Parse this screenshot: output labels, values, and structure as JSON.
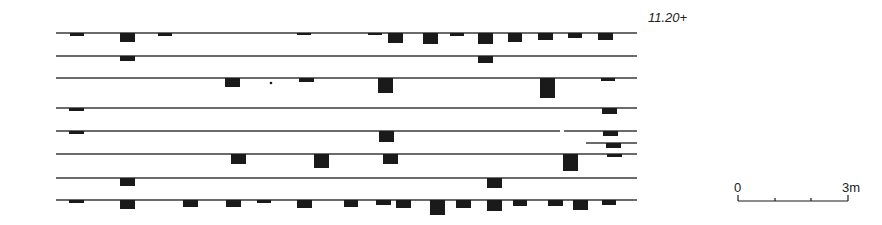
{
  "level_label": "11.20+",
  "scale": {
    "start_label": "0",
    "end_label": "3m",
    "x_start": 738,
    "x_end": 848,
    "y": 201,
    "ticks": [
      738,
      775,
      811,
      848
    ]
  },
  "colors": {
    "ink": "#1a1a1a",
    "line": "#3a3a3a",
    "background": "#ffffff"
  },
  "courses": [
    {
      "y": 33,
      "x1": 56,
      "x2": 637,
      "blocks": [
        [
          70,
          84,
          3
        ],
        [
          120,
          135,
          9
        ],
        [
          158,
          172,
          3
        ],
        [
          297,
          311,
          2
        ],
        [
          368,
          382,
          2
        ],
        [
          388,
          403,
          10
        ],
        [
          423,
          438,
          11
        ],
        [
          450,
          464,
          3
        ],
        [
          478,
          493,
          11
        ],
        [
          508,
          522,
          9
        ],
        [
          538,
          553,
          7
        ],
        [
          568,
          582,
          5
        ],
        [
          598,
          613,
          7
        ]
      ]
    },
    {
      "y": 56,
      "x1": 56,
      "x2": 637,
      "blocks": [
        [
          120,
          135,
          5
        ],
        [
          478,
          493,
          7
        ]
      ]
    },
    {
      "y": 78,
      "x1": 56,
      "x2": 637,
      "blocks": [
        [
          225,
          240,
          9
        ],
        [
          299,
          314,
          4
        ],
        [
          378,
          393,
          15
        ],
        [
          540,
          555,
          20
        ],
        [
          601,
          615,
          3
        ]
      ]
    },
    {
      "y": 108,
      "x1": 56,
      "x2": 637,
      "blocks": [
        [
          69,
          84,
          3
        ],
        [
          602,
          617,
          6
        ]
      ]
    },
    {
      "y": 131,
      "x1": 56,
      "x2": 560,
      "blocks": [
        [
          69,
          84,
          3
        ],
        [
          379,
          394,
          11
        ]
      ]
    },
    {
      "y": 131,
      "x1": 564,
      "x2": 637,
      "blocks": [
        [
          603,
          618,
          5
        ]
      ]
    },
    {
      "y": 143,
      "x1": 586,
      "x2": 637,
      "blocks": [
        [
          606,
          621,
          5
        ]
      ]
    },
    {
      "y": 154,
      "x1": 56,
      "x2": 637,
      "blocks": [
        [
          231,
          246,
          10
        ],
        [
          314,
          329,
          14
        ],
        [
          383,
          398,
          10
        ],
        [
          563,
          578,
          17
        ],
        [
          607,
          622,
          3
        ]
      ]
    },
    {
      "y": 178,
      "x1": 56,
      "x2": 637,
      "blocks": [
        [
          120,
          135,
          8
        ],
        [
          487,
          502,
          10
        ]
      ]
    },
    {
      "y": 200,
      "x1": 56,
      "x2": 637,
      "blocks": [
        [
          69,
          84,
          3
        ],
        [
          120,
          135,
          9
        ],
        [
          183,
          198,
          7
        ],
        [
          226,
          241,
          7
        ],
        [
          257,
          271,
          3
        ],
        [
          297,
          312,
          8
        ],
        [
          344,
          358,
          7
        ],
        [
          376,
          391,
          5
        ],
        [
          396,
          411,
          8
        ],
        [
          430,
          445,
          15
        ],
        [
          456,
          471,
          8
        ],
        [
          487,
          502,
          11
        ],
        [
          513,
          527,
          6
        ],
        [
          548,
          563,
          6
        ],
        [
          573,
          588,
          10
        ],
        [
          602,
          616,
          5
        ]
      ]
    }
  ],
  "stray_marks": [
    [
      271,
      83,
      2
    ]
  ]
}
